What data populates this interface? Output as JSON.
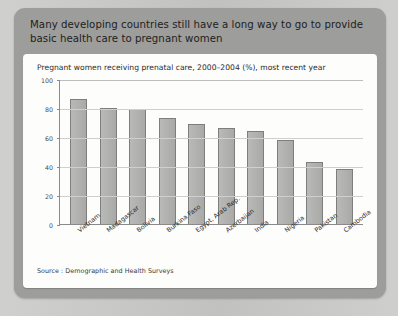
{
  "panel": {
    "title": "Many developing countries still have a long way to go to provide basic health care to pregnant women"
  },
  "card": {
    "source": "Source : Demographic and Health Surveys"
  },
  "chart_data": {
    "type": "bar",
    "title": "Pregnant women receiving prenatal care, 2000–2004 (%), most recent year",
    "xlabel": "",
    "ylabel": "",
    "ylim": [
      0,
      100
    ],
    "yticks": [
      "0",
      "20",
      "40",
      "60",
      "80",
      "100"
    ],
    "grid": true,
    "legend": "none",
    "orientation": "vertical",
    "bar_color": "#b2b2b0",
    "bar_border_color": "#7e7e7c",
    "categories": [
      "Vietnam",
      "Madagascar",
      "Bolivia",
      "Burkina Faso",
      "Egypt, Arab Rep.",
      "Azerbaijan",
      "India",
      "Nigeria",
      "Pakistan",
      "Cambodia"
    ],
    "values": [
      86,
      80,
      79,
      73,
      69,
      66,
      64,
      58,
      43,
      38
    ]
  }
}
